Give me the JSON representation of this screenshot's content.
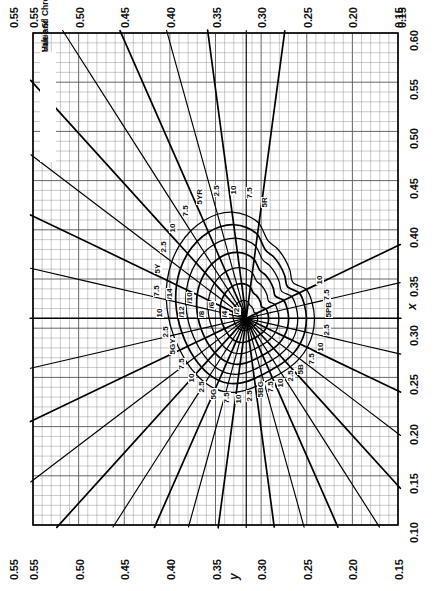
{
  "chart": {
    "title_line1": "Hue and Chroma",
    "title_line2": "Value 5/",
    "type": "munsell-chromaticity-diagram"
  },
  "axes": {
    "x_axis": {
      "name": "x",
      "position": "right",
      "ticks": [
        "0.60",
        "0.55",
        "0.50",
        "0.45",
        "0.40",
        "0.35",
        "0.30",
        "0.25",
        "0.20",
        "0.15",
        "0.10"
      ]
    },
    "y_axis": {
      "name": "y",
      "position": "bottom",
      "ticks": [
        "0.55",
        "0.50",
        "0.45",
        "0.40",
        "0.35",
        "0.30",
        "0.25",
        "0.20",
        "0.15"
      ]
    },
    "top_axis": {
      "ticks": [
        "0.55",
        "0.50",
        "0.45",
        "0.40",
        "0.35",
        "0.30",
        "0.25",
        "0.20",
        "0.15"
      ]
    },
    "left_axis": {
      "ticks": [
        "0.55",
        "0.55"
      ]
    }
  },
  "hue_labels": [
    "10",
    "7.5",
    "5Y",
    "2.5",
    "10",
    "7.5",
    "5GY",
    "2.5",
    "10",
    "7.5",
    "5G",
    "2.5",
    "7.5",
    "5YR",
    "2.5",
    "7.5",
    "5R",
    "2.5",
    "10",
    "7.5",
    "5",
    "2.5",
    "10",
    "7.5",
    "5BG",
    "2.5",
    "10",
    "7.5",
    "5B",
    "2.5",
    "5PB",
    "10",
    "7.5",
    "10",
    "2.5"
  ],
  "chroma_labels": [
    "/14",
    "/12",
    "/10",
    "/8",
    "/6",
    "/4",
    "/2"
  ],
  "chart_data": {
    "type": "line",
    "title": "Hue and Chroma Value 5/",
    "xlabel": "x",
    "ylabel": "y",
    "xlim": [
      0.1,
      0.6
    ],
    "ylim": [
      0.15,
      0.55
    ],
    "grid": true,
    "legend": "none",
    "note": "Munsell hue lines radiate from the neutral point; chroma contours are closed loops around it.",
    "neutral_point": {
      "x": 0.3101,
      "y": 0.3163
    },
    "hue_lines": [
      {
        "hue": "5R",
        "label": "5R"
      },
      {
        "hue": "7.5R",
        "label": "7.5"
      },
      {
        "hue": "10R",
        "label": "10"
      },
      {
        "hue": "2.5YR",
        "label": "2.5"
      },
      {
        "hue": "5YR",
        "label": "5YR"
      },
      {
        "hue": "7.5YR",
        "label": "7.5"
      },
      {
        "hue": "10YR",
        "label": "10"
      },
      {
        "hue": "2.5Y",
        "label": "2.5"
      },
      {
        "hue": "5Y",
        "label": "5Y"
      },
      {
        "hue": "7.5Y",
        "label": "7.5"
      },
      {
        "hue": "10Y",
        "label": "10"
      },
      {
        "hue": "2.5GY",
        "label": "2.5"
      },
      {
        "hue": "5GY",
        "label": "5GY"
      },
      {
        "hue": "7.5GY",
        "label": "7.5"
      },
      {
        "hue": "10GY",
        "label": "10"
      },
      {
        "hue": "2.5G",
        "label": "2.5"
      },
      {
        "hue": "5G",
        "label": "5G"
      },
      {
        "hue": "7.5G",
        "label": "7.5"
      },
      {
        "hue": "10G",
        "label": "10"
      },
      {
        "hue": "2.5BG",
        "label": "2.5"
      },
      {
        "hue": "5BG",
        "label": "5BG"
      },
      {
        "hue": "7.5BG",
        "label": "7.5"
      },
      {
        "hue": "10BG",
        "label": "10"
      },
      {
        "hue": "2.5B",
        "label": "2.5"
      },
      {
        "hue": "5B",
        "label": "5B"
      },
      {
        "hue": "7.5B",
        "label": "7.5"
      },
      {
        "hue": "10B",
        "label": "10"
      },
      {
        "hue": "2.5PB",
        "label": "2.5"
      },
      {
        "hue": "5PB",
        "label": "5PB"
      },
      {
        "hue": "7.5PB",
        "label": "7.5"
      },
      {
        "hue": "10PB",
        "label": "10"
      }
    ],
    "chroma_contours": [
      {
        "chroma": 2,
        "label": "/2"
      },
      {
        "chroma": 4,
        "label": "/4"
      },
      {
        "chroma": 6,
        "label": "/6"
      },
      {
        "chroma": 8,
        "label": "/8"
      },
      {
        "chroma": 10,
        "label": "/10"
      },
      {
        "chroma": 12,
        "label": "/12"
      },
      {
        "chroma": 14,
        "label": "/14"
      }
    ]
  },
  "colors": {
    "line": "#000000",
    "grid_minor": "#8a8a8a",
    "grid_major": "#555555",
    "background": "#ffffff"
  }
}
